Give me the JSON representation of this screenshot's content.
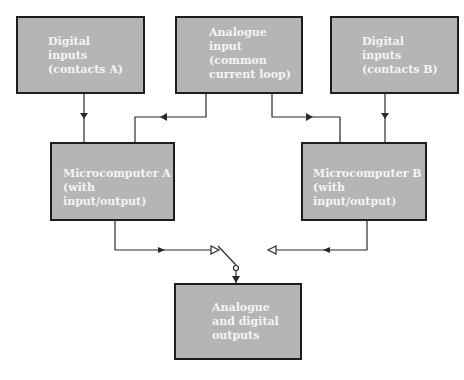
{
  "diagram": {
    "type": "block diagram",
    "nodes": {
      "digital_a": {
        "label": "Digital\ninputs\n(contacts A)"
      },
      "analogue_in": {
        "label": "Analogue\ninput\n(common\ncurrent loop)"
      },
      "digital_b": {
        "label": "Digital\ninputs\n(contacts B)"
      },
      "micro_a": {
        "label": "Microcomputer A\n(with input/output)"
      },
      "micro_b": {
        "label": "Microcomputer B\n(with input/output)"
      },
      "outputs": {
        "label": "Analogue\nand digital\noutputs"
      }
    },
    "edges": [
      {
        "from": "Digital inputs (contacts A)",
        "to": "Microcomputer A"
      },
      {
        "from": "Analogue input (common current loop)",
        "to": "Microcomputer A"
      },
      {
        "from": "Analogue input (common current loop)",
        "to": "Microcomputer B"
      },
      {
        "from": "Digital inputs (contacts B)",
        "to": "Microcomputer B"
      },
      {
        "from": "Microcomputer A",
        "to": "Changeover switch (position A)"
      },
      {
        "from": "Microcomputer B",
        "to": "Changeover switch (position B)"
      },
      {
        "from": "Changeover switch",
        "to": "Analogue and digital outputs"
      }
    ],
    "colors": {
      "box_fill": "#b5b5b5",
      "box_border": "#1e1e1e",
      "text": "#f4f4f4",
      "wire": "#2a2a2a"
    }
  }
}
